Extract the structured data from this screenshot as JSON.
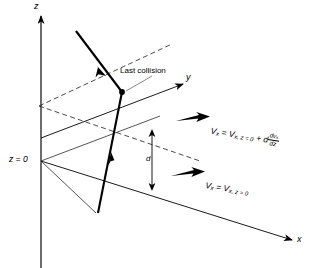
{
  "figure": {
    "type": "physics-diagram"
  },
  "axes": {
    "z_label": "z",
    "y_label": "y",
    "x_label": "x",
    "origin_label": "z = 0"
  },
  "annotations": {
    "last_collision": "Last collision",
    "distance_label": "d"
  },
  "equations": {
    "upper": {
      "lhs": "V",
      "lhs_sub": "x",
      "eq1": " = ",
      "rhs_main": "V",
      "rhs_sub": "x, z = 0",
      "plus": " + ",
      "coeff": "d",
      "frac_num": "dv",
      "frac_num_sub": "x",
      "frac_den": "dz",
      "plain": "V_x = V_x,z=0 + d dv_x/dz"
    },
    "lower": {
      "lhs": "V",
      "lhs_sub": "x",
      "eq1": " = ",
      "rhs_main": "V",
      "rhs_sub": "x, z = 0",
      "plain": "V_x = V_x,z=0"
    }
  },
  "colors": {
    "ink": "#000000",
    "background": "#ffffff",
    "plane_line": "#333333",
    "leader": "#555555"
  },
  "elements": {
    "velocity_arrow_upper": "thick-right-arrow",
    "velocity_arrow_lower": "thick-right-arrow",
    "distance_arrow": "double-headed-vertical-arrow",
    "collision_dot": "filled-circle",
    "upper_plane": "dashed-parallelogram",
    "lower_plane": "solid-parallelogram",
    "trajectory": "zigzag-polyline-with-arrowheads"
  }
}
